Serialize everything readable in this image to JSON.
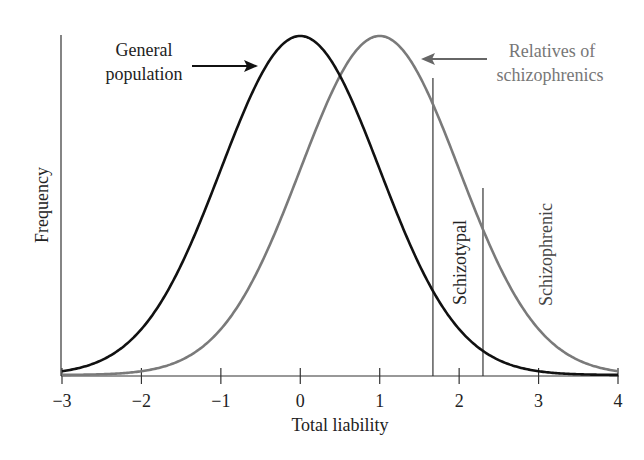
{
  "chart_data": {
    "type": "line",
    "title": "",
    "xlabel": "Total liability",
    "ylabel": "Frequency",
    "xlim": [
      -3,
      4
    ],
    "ylim": [
      0,
      1
    ],
    "grid": false,
    "legend": "inline annotations with arrows",
    "x_ticks": [
      -3,
      -2,
      -1,
      0,
      1,
      2,
      3,
      4
    ],
    "x_tick_labels": [
      "−3",
      "−2",
      "−1",
      "0",
      "1",
      "2",
      "3",
      "4"
    ],
    "series": [
      {
        "name": "General population",
        "color": "#111111",
        "distribution": "normal",
        "mean": 0,
        "sd": 1,
        "x": [
          -3,
          -2,
          -1,
          0,
          1,
          2,
          3,
          4
        ],
        "values": [
          0.01,
          0.14,
          0.61,
          1.0,
          0.61,
          0.14,
          0.01,
          0.0
        ]
      },
      {
        "name": "Relatives of schizophrenics",
        "color": "#7a7a7a",
        "distribution": "normal",
        "mean": 1,
        "sd": 1,
        "x": [
          -3,
          -2,
          -1,
          0,
          1,
          2,
          3,
          4
        ],
        "values": [
          0.0,
          0.01,
          0.14,
          0.61,
          1.0,
          0.61,
          0.14,
          0.01
        ]
      }
    ],
    "thresholds": [
      {
        "name": "Schizotypal",
        "x": 1.67
      },
      {
        "name": "Schizophrenic",
        "x": 2.3
      }
    ],
    "annotations": [
      {
        "text": "General population",
        "points_to": "General population curve"
      },
      {
        "text": "Relatives of schizophrenics",
        "points_to": "Relatives of schizophrenics curve"
      },
      {
        "text": "Schizotypal",
        "orientation": "vertical",
        "region": "between thresholds"
      },
      {
        "text": "Schizophrenic",
        "orientation": "vertical",
        "region": "right of second threshold"
      }
    ]
  },
  "labels": {
    "general_line1": "General",
    "general_line2": "population",
    "relatives_line1": "Relatives of",
    "relatives_line2": "schizophrenics",
    "schizotypal": "Schizotypal",
    "schizophrenic": "Schizophrenic",
    "xlabel": "Total liability",
    "ylabel": "Frequency",
    "ticks": [
      "−3",
      "−2",
      "−1",
      "0",
      "1",
      "2",
      "3",
      "4"
    ]
  }
}
